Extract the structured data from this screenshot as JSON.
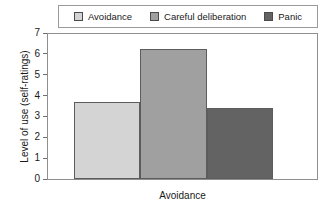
{
  "chart_data": {
    "type": "bar",
    "title": "",
    "xlabel": "Avoidance",
    "ylabel": "Level of use (self-ratings)",
    "categories": [
      "Avoidance"
    ],
    "ylim": [
      0,
      7
    ],
    "yticks": [
      0,
      1,
      2,
      3,
      4,
      5,
      6,
      7
    ],
    "grid": false,
    "legend_position": "top",
    "series": [
      {
        "name": "Avoidance",
        "values": [
          3.7
        ],
        "color": "#d4d4d4"
      },
      {
        "name": "Careful deliberation",
        "values": [
          6.3
        ],
        "color": "#a0a0a0"
      },
      {
        "name": "Panic",
        "values": [
          3.45
        ],
        "color": "#636363"
      }
    ]
  },
  "legend": {
    "entries": [
      {
        "label": "Avoidance",
        "color": "#d4d4d4"
      },
      {
        "label": "Careful deliberation",
        "color": "#a0a0a0"
      },
      {
        "label": "Panic",
        "color": "#636363"
      }
    ]
  },
  "axes": {
    "y_title": "Level of use (self-ratings)",
    "y_tick_labels": [
      "7",
      "6",
      "5",
      "4",
      "3",
      "2",
      "1",
      "0"
    ],
    "x_category_label": "Avoidance"
  }
}
